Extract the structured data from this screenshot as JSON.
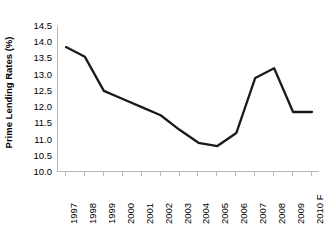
{
  "chart_data": {
    "type": "line",
    "title": "",
    "xlabel": "",
    "ylabel": "Prime Lending Rates (%)",
    "categories": [
      "1997",
      "1998",
      "1999",
      "2000",
      "2001",
      "2002",
      "2003",
      "2004",
      "2005",
      "2006",
      "2007",
      "2008",
      "2009",
      "2010 F"
    ],
    "values": [
      13.85,
      13.55,
      12.5,
      12.25,
      12.0,
      11.75,
      11.3,
      10.9,
      10.8,
      11.2,
      12.9,
      13.2,
      11.85,
      11.85
    ],
    "series": [
      {
        "name": "Prime Lending Rates (%)",
        "values": [
          13.85,
          13.55,
          12.5,
          12.25,
          12.0,
          11.75,
          11.3,
          10.9,
          10.8,
          11.2,
          12.9,
          13.2,
          11.85,
          11.85
        ]
      }
    ],
    "ylim": [
      10.0,
      14.5
    ],
    "ytick_values": [
      10.0,
      10.5,
      11.0,
      11.5,
      12.0,
      12.5,
      13.0,
      13.5,
      14.0,
      14.5
    ],
    "ytick_labels": [
      "10.0",
      "10.5",
      "11.0",
      "11.5",
      "12.0",
      "12.5",
      "13.0",
      "13.5",
      "14.0",
      "14.5"
    ],
    "grid": false,
    "legend": false,
    "legend_position": "none",
    "line_color": "#1a1a1a",
    "line_width": 2.3,
    "markers": false,
    "axis_color": "#b9b9b9",
    "background_color": "#ffffff"
  }
}
